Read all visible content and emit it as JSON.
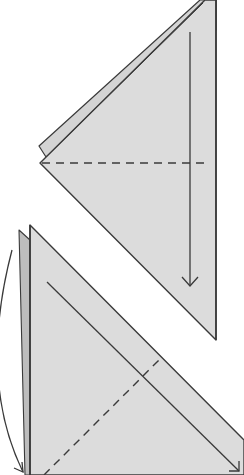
{
  "diagram": {
    "type": "origami-fold-instructions",
    "colors": {
      "background": "#ffffff",
      "paper": "#dcdcdc",
      "paper_back": "#c8c8c8",
      "outline": "#3a3a3a",
      "fold_line": "#3a3a3a"
    },
    "steps": [
      {
        "id": "step-top",
        "description": "Triangle with valley-fold dashed line; arrow indicates folding the top point down",
        "fold_type": "valley-fold-dashed",
        "arrow": "straight-down"
      },
      {
        "id": "step-bottom",
        "description": "Triangle with diagonal valley-fold dashed line; arrows indicate folding toward bottom-right and turning over",
        "fold_type": "valley-fold-dashed",
        "arrows": [
          "diagonal-down-right",
          "curved-turn-over"
        ]
      }
    ]
  }
}
